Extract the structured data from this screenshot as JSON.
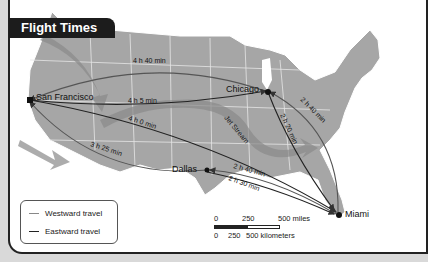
{
  "title": "Flight Times",
  "cities": {
    "san_francisco": "San Francisco",
    "chicago": "Chicago",
    "dallas": "Dallas",
    "miami": "Miami"
  },
  "routes": [
    {
      "from": "San Francisco",
      "to": "Chicago",
      "direction": "eastward",
      "time": "4 h 5 min"
    },
    {
      "from": "Chicago",
      "to": "San Francisco",
      "direction": "westward",
      "time": "4 h 40 min"
    },
    {
      "from": "San Francisco",
      "to": "Miami",
      "direction": "eastward",
      "time": "4 h 0 min"
    },
    {
      "from": "Dallas",
      "to": "San Francisco",
      "direction": "westward",
      "time": "3 h 25 min"
    },
    {
      "from": "Chicago",
      "to": "Miami",
      "direction": "eastward",
      "time": "2 h 20 min"
    },
    {
      "from": "Miami",
      "to": "Chicago",
      "direction": "westward",
      "time": "2 h 40 min"
    },
    {
      "from": "Miami",
      "to": "Dallas",
      "direction": "westward",
      "time": "2 h 40 min"
    },
    {
      "from": "Dallas",
      "to": "Miami",
      "direction": "eastward",
      "time": "2 h 30 min"
    }
  ],
  "labels": {
    "sf_chi_west": "4 h 40 min",
    "sf_chi_east": "4 h 5 min",
    "sf_mia": "4 h 0 min",
    "sf_dal": "3 h 25 min",
    "chi_mia_west": "2 h 40 min",
    "chi_mia_east": "2 h 20 min",
    "dal_mia_west": "2 h 40 min",
    "dal_mia_east": "2 h 30 min",
    "jet_stream": "Jet Stream"
  },
  "legend": {
    "westward": "Westward travel",
    "eastward": "Eastward travel",
    "colors": {
      "westward": "#888888",
      "eastward": "#222222"
    }
  },
  "scale": {
    "miles_ticks": [
      "0",
      "250",
      "500 miles"
    ],
    "km_ticks": [
      "0",
      "250",
      "500 kilometers"
    ]
  }
}
